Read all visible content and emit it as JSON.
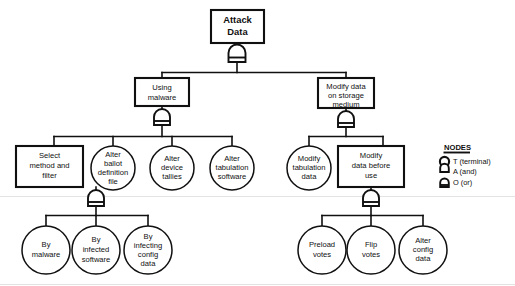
{
  "diagram": {
    "title_text": "Attack Data",
    "shape_legend": {
      "heading": "NODES",
      "entries": [
        {
          "symbol": "circle-terminal-icon",
          "label": "T  (terminal)"
        },
        {
          "symbol": "and-gate-icon",
          "label": "A (and)"
        },
        {
          "symbol": "or-gate-icon",
          "label": "O (or)"
        }
      ]
    },
    "levels": {
      "level0": [
        {
          "id": "attack-data",
          "lines": [
            "Attack",
            "Data"
          ],
          "shape": "rect",
          "gate": "or"
        }
      ],
      "level1": [
        {
          "id": "using-malware",
          "lines": [
            "Using",
            "malware"
          ],
          "shape": "rect",
          "gate": "or"
        },
        {
          "id": "modify-data-storage",
          "lines": [
            "Modify data",
            "on storage",
            "medium"
          ],
          "shape": "rect",
          "gate": "or"
        }
      ],
      "level2": [
        {
          "id": "select-method-filter",
          "lines": [
            "Select",
            "method and",
            "filter"
          ],
          "shape": "rect",
          "gate": "or"
        },
        {
          "id": "alter-ballot-definition-file",
          "lines": [
            "Alter",
            "ballot",
            "definition",
            "file"
          ],
          "shape": "circle",
          "gate": "none"
        },
        {
          "id": "alter-device-tallies",
          "lines": [
            "Alter",
            "device",
            "tallies"
          ],
          "shape": "circle",
          "gate": "none"
        },
        {
          "id": "alter-tabulation-software",
          "lines": [
            "Alter",
            "tabulation",
            "software"
          ],
          "shape": "circle",
          "gate": "none"
        },
        {
          "id": "modify-tabulation-data",
          "lines": [
            "Modify",
            "tabulation",
            "data"
          ],
          "shape": "circle",
          "gate": "none"
        },
        {
          "id": "modify-data-before-use",
          "lines": [
            "Modify",
            "data before",
            "use"
          ],
          "shape": "rect",
          "gate": "or"
        }
      ],
      "level3": [
        {
          "id": "by-malware",
          "lines": [
            "By",
            "malware"
          ],
          "shape": "circle",
          "gate": "none"
        },
        {
          "id": "by-infected-software",
          "lines": [
            "By",
            "infected",
            "software"
          ],
          "shape": "circle",
          "gate": "none"
        },
        {
          "id": "by-infecting-config-data",
          "lines": [
            "By",
            "infecting",
            "config",
            "data"
          ],
          "shape": "circle",
          "gate": "none"
        },
        {
          "id": "preload-votes",
          "lines": [
            "Preload",
            "votes"
          ],
          "shape": "circle",
          "gate": "none"
        },
        {
          "id": "flip-votes",
          "lines": [
            "Flip",
            "votes"
          ],
          "shape": "circle",
          "gate": "none"
        },
        {
          "id": "alter-config-data",
          "lines": [
            "Alter",
            "config",
            "data"
          ],
          "shape": "circle",
          "gate": "none"
        }
      ]
    },
    "colors": {
      "stroke": "#101010",
      "fill": "#ffffff",
      "background": "#ffffff"
    }
  }
}
